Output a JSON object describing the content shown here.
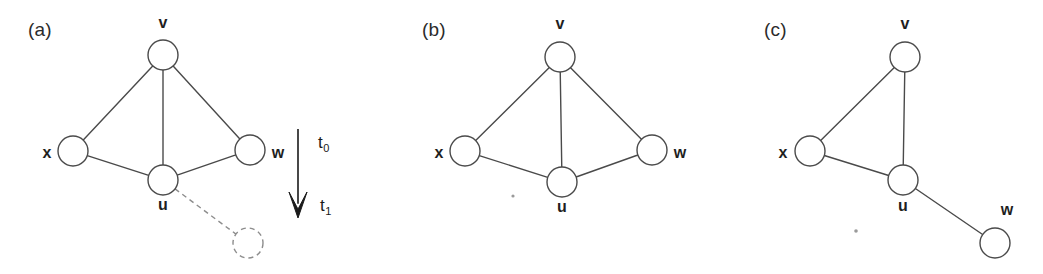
{
  "figure": {
    "background_color": "#ffffff",
    "stroke_color": "#4a4a4a",
    "ghost_color": "#8d8d8d",
    "arrow_color": "#1a1a1a",
    "width": 1043,
    "height": 274
  },
  "panels": [
    {
      "id": "panel-a",
      "label": "(a)",
      "label_pos": {
        "x": 28,
        "y": 36
      },
      "nodes": [
        {
          "id": "v",
          "label": "v",
          "cx": 163,
          "cy": 55,
          "r": 15,
          "ghost": false,
          "label_x": 163,
          "label_y": 28,
          "label_anchor": "middle"
        },
        {
          "id": "x",
          "label": "x",
          "cx": 73,
          "cy": 151,
          "r": 15,
          "ghost": false,
          "label_x": 47,
          "label_y": 158,
          "label_anchor": "middle"
        },
        {
          "id": "w",
          "label": "w",
          "cx": 250,
          "cy": 150,
          "r": 15,
          "ghost": false,
          "label_x": 278,
          "label_y": 158,
          "label_anchor": "middle"
        },
        {
          "id": "u",
          "label": "u",
          "cx": 163,
          "cy": 180,
          "r": 15,
          "ghost": false,
          "label_x": 163,
          "label_y": 210,
          "label_anchor": "middle"
        },
        {
          "id": "ghost",
          "label": "",
          "cx": 248,
          "cy": 243,
          "r": 15,
          "ghost": true,
          "label_x": 248,
          "label_y": 243,
          "label_anchor": "middle"
        }
      ],
      "edges": [
        {
          "from": "v",
          "to": "x",
          "dashed": false
        },
        {
          "from": "v",
          "to": "u",
          "dashed": false
        },
        {
          "from": "v",
          "to": "w",
          "dashed": false
        },
        {
          "from": "x",
          "to": "u",
          "dashed": false
        },
        {
          "from": "u",
          "to": "w",
          "dashed": false
        },
        {
          "from": "u",
          "to": "ghost",
          "dashed": true
        }
      ]
    },
    {
      "id": "panel-b",
      "label": "(b)",
      "label_pos": {
        "x": 422,
        "y": 36
      },
      "nodes": [
        {
          "id": "v",
          "label": "v",
          "cx": 560,
          "cy": 57,
          "r": 15,
          "ghost": false,
          "label_x": 560,
          "label_y": 29,
          "label_anchor": "middle"
        },
        {
          "id": "x",
          "label": "x",
          "cx": 465,
          "cy": 151,
          "r": 15,
          "ghost": false,
          "label_x": 439,
          "label_y": 158,
          "label_anchor": "middle"
        },
        {
          "id": "w",
          "label": "w",
          "cx": 652,
          "cy": 150,
          "r": 15,
          "ghost": false,
          "label_x": 680,
          "label_y": 158,
          "label_anchor": "middle"
        },
        {
          "id": "u",
          "label": "u",
          "cx": 562,
          "cy": 182,
          "r": 15,
          "ghost": false,
          "label_x": 562,
          "label_y": 212,
          "label_anchor": "middle"
        }
      ],
      "edges": [
        {
          "from": "v",
          "to": "x",
          "dashed": false
        },
        {
          "from": "v",
          "to": "u",
          "dashed": false
        },
        {
          "from": "v",
          "to": "w",
          "dashed": false
        },
        {
          "from": "x",
          "to": "u",
          "dashed": false
        },
        {
          "from": "u",
          "to": "w",
          "dashed": false
        }
      ]
    },
    {
      "id": "panel-c",
      "label": "(c)",
      "label_pos": {
        "x": 764,
        "y": 36
      },
      "nodes": [
        {
          "id": "v",
          "label": "v",
          "cx": 905,
          "cy": 57,
          "r": 15,
          "ghost": false,
          "label_x": 905,
          "label_y": 29,
          "label_anchor": "middle"
        },
        {
          "id": "x",
          "label": "x",
          "cx": 810,
          "cy": 151,
          "r": 15,
          "ghost": false,
          "label_x": 783,
          "label_y": 158,
          "label_anchor": "middle"
        },
        {
          "id": "u",
          "label": "u",
          "cx": 903,
          "cy": 180,
          "r": 15,
          "ghost": false,
          "label_x": 903,
          "label_y": 211,
          "label_anchor": "middle"
        },
        {
          "id": "w",
          "label": "w",
          "cx": 995,
          "cy": 243,
          "r": 15,
          "ghost": false,
          "label_x": 1007,
          "label_y": 215,
          "label_anchor": "middle"
        }
      ],
      "edges": [
        {
          "from": "v",
          "to": "x",
          "dashed": false
        },
        {
          "from": "v",
          "to": "u",
          "dashed": false
        },
        {
          "from": "x",
          "to": "u",
          "dashed": false
        },
        {
          "from": "u",
          "to": "w",
          "dashed": false
        }
      ]
    }
  ],
  "time_arrow": {
    "x": 298,
    "y_start": 129,
    "y_end": 218,
    "head_half_width": 9,
    "head_length": 26,
    "labels": [
      {
        "id": "t0",
        "base": "t",
        "sub": "0",
        "x": 318,
        "y": 148
      },
      {
        "id": "t1",
        "base": "t",
        "sub": "1",
        "x": 320,
        "y": 211
      }
    ]
  },
  "specks": [
    {
      "x": 513,
      "y": 196,
      "r": 1.6
    },
    {
      "x": 856,
      "y": 231,
      "r": 1.8
    }
  ]
}
